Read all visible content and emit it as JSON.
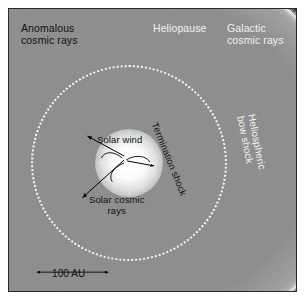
{
  "figure": {
    "background_color": "#ffffff",
    "frame_color": "#2a2a2a"
  },
  "regions": {
    "heliosheath_color": "#8a8a8a",
    "deep_space_color": "#050505",
    "sun_color": "#ffffff",
    "boundary_color": "#f2f2f2"
  },
  "labels": {
    "anomalous_cosmic_rays": "Anomalous\ncosmic rays",
    "heliopause": "Heliopause",
    "galactic_cosmic_rays": "Galactic\ncosmic rays",
    "solar_wind": "Solar wind",
    "solar_cosmic_rays": "Solar cosmic\nrays",
    "termination_shock": "Termination shock",
    "heliospheric_bow_shock": "Heliospheric bow shock"
  },
  "scale_bar": {
    "label": "100 AU"
  }
}
